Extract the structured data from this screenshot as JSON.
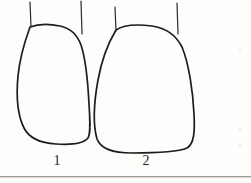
{
  "figure": {
    "kind": "scanned-line-drawing",
    "background_color": "#fdfdfc",
    "ink_color": "#1d1d1d",
    "width": 251,
    "height": 183,
    "caption_rule": {
      "present": true,
      "color": "#9b9b9b",
      "y": 176
    },
    "specimens": [
      {
        "label": "1",
        "name": "tooth-outline-left",
        "description": "closed tooth crown outline, rounded-trapezoid, flat base",
        "label_x": 57,
        "label_y": 161,
        "outline_path": "M 30 27 C 26 38, 20 55, 18 76 C 16 97, 18 116, 24 128 C 29 138, 40 143, 56 144 C 72 145, 84 143, 88 138 C 91 133, 90 120, 89 104 C 88 84, 86 60, 81 45 C 77 34, 70 28, 60 26 C 50 24, 38 24, 30 27 Z",
        "root_lines": [
          {
            "name": "root-line-left",
            "x1": 30,
            "y1": 2,
            "x2": 31,
            "y2": 27
          },
          {
            "name": "root-line-right",
            "x1": 81,
            "y1": 1,
            "x2": 82,
            "y2": 34
          }
        ]
      },
      {
        "label": "2",
        "name": "tooth-outline-right",
        "description": "closed tooth crown outline, rounded-trapezoid, rounded base",
        "label_x": 146,
        "label_y": 161,
        "outline_path": "M 116 30 C 110 40, 102 58, 98 80 C 94 102, 93 125, 97 139 C 101 149, 112 153, 132 153 C 156 153, 178 152, 187 148 C 194 144, 195 132, 194 114 C 193 92, 189 64, 182 47 C 176 35, 166 28, 152 26 C 136 24, 123 25, 116 30 Z",
        "root_lines": [
          {
            "name": "root-line-left",
            "x1": 115,
            "y1": 7,
            "x2": 116,
            "y2": 31
          },
          {
            "name": "root-line-right",
            "x1": 177,
            "y1": 3,
            "x2": 178,
            "y2": 34
          }
        ]
      }
    ],
    "scan_specks": [
      {
        "x": 97,
        "y": 32,
        "size": 1
      },
      {
        "x": 193,
        "y": 31,
        "size": 1
      },
      {
        "x": 216,
        "y": 49,
        "size": 1
      },
      {
        "x": 239,
        "y": 49,
        "size": 2
      },
      {
        "x": 137,
        "y": 96,
        "size": 1
      },
      {
        "x": 90,
        "y": 110,
        "size": 1
      },
      {
        "x": 125,
        "y": 110,
        "size": 1
      },
      {
        "x": 238,
        "y": 110,
        "size": 1
      },
      {
        "x": 90,
        "y": 127,
        "size": 1
      },
      {
        "x": 239,
        "y": 128,
        "size": 2
      },
      {
        "x": 129,
        "y": 144,
        "size": 1
      },
      {
        "x": 212,
        "y": 144,
        "size": 1
      },
      {
        "x": 239,
        "y": 144,
        "size": 2
      }
    ]
  }
}
